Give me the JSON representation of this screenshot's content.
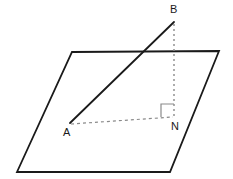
{
  "diagram": {
    "type": "geometry-3d-plane-perpendicular",
    "canvas": {
      "width": 233,
      "height": 179,
      "background": "#ffffff"
    },
    "plane": {
      "name": "parallelogram-plane",
      "stroke": "#1a1a1a",
      "stroke_width": 1.8,
      "fill": "none",
      "points": "72,52 219,51 170,172 17,172",
      "corners": [
        {
          "id": "plane-top-left",
          "x": 72,
          "y": 52
        },
        {
          "id": "plane-top-right",
          "x": 219,
          "y": 51
        },
        {
          "id": "plane-bottom-right",
          "x": 170,
          "y": 172
        },
        {
          "id": "plane-bottom-left",
          "x": 17,
          "y": 172
        }
      ]
    },
    "points": [
      {
        "id": "A",
        "label": "A",
        "x": 70,
        "y": 123,
        "label_x": 63,
        "label_y": 136
      },
      {
        "id": "B",
        "label": "B",
        "x": 174,
        "y": 22,
        "label_x": 170,
        "label_y": 13
      },
      {
        "id": "N",
        "label": "N",
        "x": 174,
        "y": 117,
        "label_x": 171,
        "label_y": 130
      }
    ],
    "segments": [
      {
        "id": "segment-AB",
        "from": "A",
        "to": "B",
        "style": "solid",
        "stroke": "#1a1a1a",
        "stroke_width": 1.8,
        "x1": 70,
        "y1": 123,
        "x2": 174,
        "y2": 22
      },
      {
        "id": "segment-BN",
        "from": "B",
        "to": "N",
        "style": "dotted",
        "stroke": "#8a8a8a",
        "stroke_width": 1.4,
        "dash": "2,3",
        "x1": 174,
        "y1": 24,
        "x2": 174,
        "y2": 117
      },
      {
        "id": "segment-AN",
        "from": "A",
        "to": "N",
        "style": "dashed",
        "stroke": "#8a8a8a",
        "stroke_width": 1.2,
        "dash": "3,3",
        "x1": 71,
        "y1": 124,
        "x2": 173,
        "y2": 117
      }
    ],
    "right_angle": {
      "id": "right-angle-marker-N",
      "at_point": "N",
      "label": "right angle",
      "stroke": "#8a8a8a",
      "stroke_width": 1.2,
      "path": "M 161,117 L 161,104 L 174,104"
    }
  }
}
